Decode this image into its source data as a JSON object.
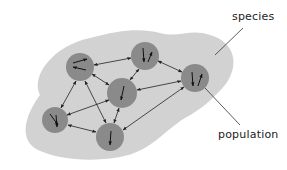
{
  "labels": {
    "species": "species",
    "population": "population"
  },
  "colors": {
    "background": "#ffffff",
    "species_region": "#d2d2d2",
    "population": "#8a8a8a",
    "edges": "#222222"
  },
  "diagram": {
    "title": "",
    "populations": [
      {
        "id": "A",
        "cx": 80,
        "cy": 67,
        "r": 14
      },
      {
        "id": "B",
        "cx": 145,
        "cy": 56,
        "r": 14
      },
      {
        "id": "C",
        "cx": 122,
        "cy": 93,
        "r": 15
      },
      {
        "id": "D",
        "cx": 195,
        "cy": 78,
        "r": 14
      },
      {
        "id": "E",
        "cx": 55,
        "cy": 120,
        "r": 13
      },
      {
        "id": "F",
        "cx": 110,
        "cy": 137,
        "r": 14
      }
    ],
    "links": [
      {
        "from": "A",
        "to": "B",
        "bidirectional": true
      },
      {
        "from": "A",
        "to": "C",
        "bidirectional": true
      },
      {
        "from": "A",
        "to": "E",
        "bidirectional": true
      },
      {
        "from": "A",
        "to": "F",
        "bidirectional": true
      },
      {
        "from": "B",
        "to": "C",
        "bidirectional": true
      },
      {
        "from": "B",
        "to": "D",
        "bidirectional": true
      },
      {
        "from": "C",
        "to": "D",
        "bidirectional": true
      },
      {
        "from": "C",
        "to": "E",
        "bidirectional": true
      },
      {
        "from": "C",
        "to": "F",
        "bidirectional": true
      },
      {
        "from": "D",
        "to": "F",
        "bidirectional": true
      },
      {
        "from": "E",
        "to": "F",
        "bidirectional": true
      }
    ],
    "callouts": [
      {
        "label": "species",
        "points_to": "species-region"
      },
      {
        "label": "population",
        "points_to": "population D"
      }
    ]
  }
}
